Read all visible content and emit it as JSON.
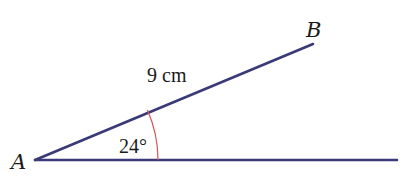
{
  "diagram": {
    "type": "angle-diagram",
    "colors": {
      "line": "#3b3a78",
      "arc": "#d9534f",
      "text": "#1a1a1a",
      "background": "#ffffff"
    },
    "points": {
      "A": {
        "label": "A",
        "x": 35,
        "y": 160
      },
      "B": {
        "label": "B",
        "x": 313,
        "y": 44
      },
      "base_end": {
        "x": 397,
        "y": 160
      }
    },
    "segments": [
      {
        "name": "AB",
        "from": "A",
        "to": "B",
        "length_label": "9 cm"
      },
      {
        "name": "base",
        "from": "A",
        "to": "base_end"
      }
    ],
    "angle": {
      "vertex": "A",
      "value_label": "24°",
      "arc_radius": 123
    },
    "labels": {
      "point_a": "A",
      "point_b": "B",
      "side_length": "9 cm",
      "angle": "24°"
    }
  }
}
